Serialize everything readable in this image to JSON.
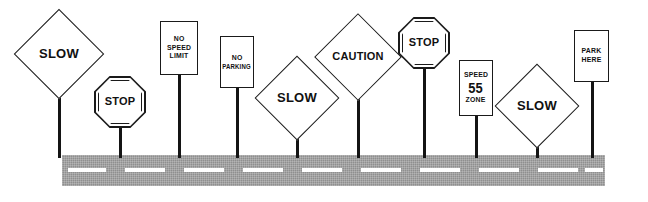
{
  "illustration": {
    "title": "Row of road signs beside a roadway",
    "background_color": "#ffffff",
    "road": {
      "name": "roadway",
      "color": "#8f8f8f",
      "stripe_color": "#ffffff",
      "left": 62,
      "right": 605,
      "top": 155,
      "bottom": 186
    },
    "pole_color": "#141414",
    "sign_fill": "#ffffff",
    "sign_outline": "#1a1a1a"
  },
  "signs": [
    {
      "id": "slow-1",
      "shape": "diamond",
      "lines": [
        "SLOW"
      ],
      "x": 27,
      "y": 22,
      "w": 64,
      "h": 64,
      "pole_x": 58,
      "pole_top": 86,
      "pole_bottom": 158
    },
    {
      "id": "stop-1",
      "shape": "octagon",
      "lines": [
        "STOP"
      ],
      "x": 94,
      "y": 76,
      "w": 52,
      "h": 52,
      "pole_x": 119,
      "pole_top": 124,
      "pole_bottom": 158
    },
    {
      "id": "no-speed-limit",
      "shape": "rectangle",
      "lines": [
        "NO",
        "SPEED",
        "LIMIT"
      ],
      "x": 160,
      "y": 21,
      "w": 38,
      "h": 54,
      "pole_x": 178,
      "pole_top": 74,
      "pole_bottom": 158
    },
    {
      "id": "no-parking",
      "shape": "rectangle",
      "lines": [
        "NO",
        "PARKING"
      ],
      "x": 220,
      "y": 36,
      "w": 34,
      "h": 52,
      "pole_x": 236,
      "pole_top": 87,
      "pole_bottom": 158
    },
    {
      "id": "slow-2",
      "shape": "diamond",
      "lines": [
        "SLOW"
      ],
      "x": 267,
      "y": 68,
      "w": 60,
      "h": 60,
      "pole_x": 296,
      "pole_top": 128,
      "pole_bottom": 158
    },
    {
      "id": "caution",
      "shape": "diamond",
      "lines": [
        "CAUTION"
      ],
      "x": 327,
      "y": 26,
      "w": 62,
      "h": 62,
      "pole_x": 357,
      "pole_top": 88,
      "pole_bottom": 158
    },
    {
      "id": "stop-2",
      "shape": "octagon",
      "lines": [
        "STOP"
      ],
      "x": 398,
      "y": 17,
      "w": 52,
      "h": 52,
      "pole_x": 423,
      "pole_top": 66,
      "pole_bottom": 158
    },
    {
      "id": "speed-55-zone",
      "shape": "rectangle",
      "lines": [
        "SPEED",
        "55",
        "ZONE"
      ],
      "x": 459,
      "y": 60,
      "w": 34,
      "h": 56,
      "pole_x": 475,
      "pole_top": 115,
      "pole_bottom": 158
    },
    {
      "id": "slow-3",
      "shape": "diamond",
      "lines": [
        "SLOW"
      ],
      "x": 507,
      "y": 76,
      "w": 60,
      "h": 60,
      "pole_x": 536,
      "pole_top": 136,
      "pole_bottom": 158
    },
    {
      "id": "park-here",
      "shape": "rectangle",
      "lines": [
        "PARK",
        "HERE"
      ],
      "x": 574,
      "y": 30,
      "w": 35,
      "h": 52,
      "pole_x": 591,
      "pole_top": 81,
      "pole_bottom": 158
    }
  ],
  "road_stripes": [
    {
      "x": 68,
      "w": 38
    },
    {
      "x": 125,
      "w": 40
    },
    {
      "x": 184,
      "w": 40
    },
    {
      "x": 243,
      "w": 40
    },
    {
      "x": 302,
      "w": 40
    },
    {
      "x": 361,
      "w": 40
    },
    {
      "x": 420,
      "w": 40
    },
    {
      "x": 479,
      "w": 40
    },
    {
      "x": 538,
      "w": 40
    },
    {
      "x": 585,
      "w": 18
    }
  ]
}
